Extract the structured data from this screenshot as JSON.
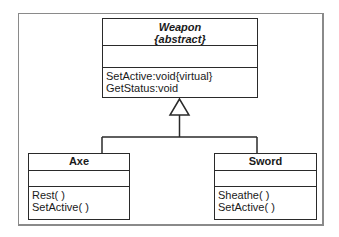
{
  "diagram": {
    "type": "uml-class-diagram",
    "classes": [
      {
        "id": "weapon",
        "name": "Weapon",
        "stereotype": "{abstract}",
        "attributes": [],
        "operations": [
          "SetActive:void{virtual}",
          "GetStatus:void"
        ]
      },
      {
        "id": "axe",
        "name": "Axe",
        "attributes": [],
        "operations": [
          "Rest( )",
          "SetActive( )"
        ]
      },
      {
        "id": "sword",
        "name": "Sword",
        "attributes": [],
        "operations": [
          "Sheathe( )",
          "SetActive( )"
        ]
      }
    ],
    "relationships": [
      {
        "type": "generalization",
        "from": "axe",
        "to": "weapon"
      },
      {
        "type": "generalization",
        "from": "sword",
        "to": "weapon"
      }
    ]
  },
  "colors": {
    "line": "#2a2a2a",
    "frame": "#8a8a8a",
    "background": "#ffffff"
  }
}
